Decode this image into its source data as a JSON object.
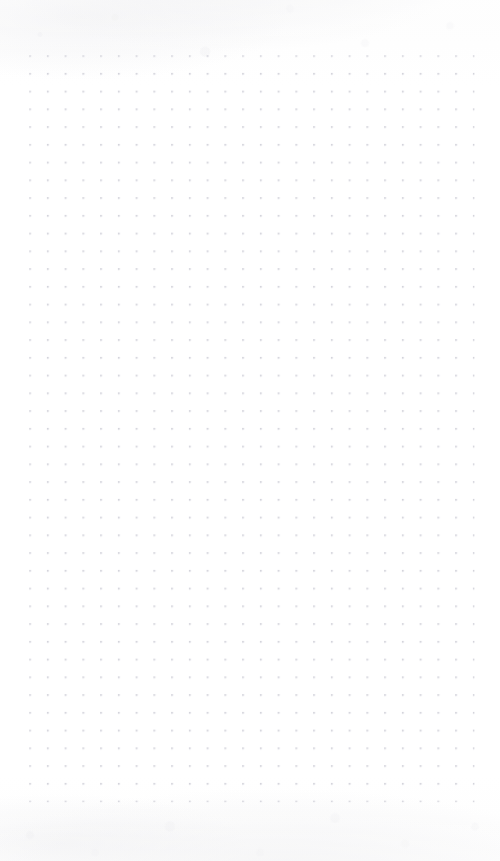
{
  "page": {
    "kind": "dot-grid-paper",
    "width_px": 500,
    "height_px": 861,
    "background_color": "#fefefe",
    "content_text": "",
    "annotations": []
  },
  "grid": {
    "dot_color": "#c9c9d2",
    "dot_radius_px": 0.85,
    "spacing_x_px": 17.75,
    "spacing_y_px": 17.75,
    "origin_x_px": 30,
    "origin_y_px": 56,
    "columns": 26,
    "rows": 43,
    "margin_left_px": 30,
    "margin_right_px": 23,
    "margin_top_px": 56,
    "margin_bottom_px": 51
  },
  "texture": {
    "top_shading_color": "#e8e8ec",
    "bottom_shading_color": "#e7e7ea",
    "opacity": 0.55
  }
}
